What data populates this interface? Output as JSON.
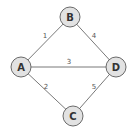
{
  "graph": {
    "nodes": [
      {
        "id": "A",
        "label": "A",
        "x": 21,
        "y": 67
      },
      {
        "id": "B",
        "label": "B",
        "x": 70,
        "y": 17
      },
      {
        "id": "C",
        "label": "C",
        "x": 73,
        "y": 116
      },
      {
        "id": "D",
        "label": "D",
        "x": 116,
        "y": 67
      }
    ],
    "edges": [
      {
        "from": "A",
        "to": "B",
        "weight": "1",
        "lx": 45,
        "ly": 38
      },
      {
        "from": "B",
        "to": "D",
        "weight": "4",
        "lx": 94,
        "ly": 38
      },
      {
        "from": "A",
        "to": "D",
        "weight": "3",
        "lx": 69,
        "ly": 64
      },
      {
        "from": "A",
        "to": "C",
        "weight": "2",
        "lx": 46,
        "ly": 89
      },
      {
        "from": "C",
        "to": "D",
        "weight": "5",
        "lx": 94,
        "ly": 89
      }
    ],
    "colors": {
      "node_fill": "#e2e2e2",
      "node_stroke": "#6a6a6a",
      "edge": "#6a6a6a",
      "text": "#333333"
    }
  }
}
